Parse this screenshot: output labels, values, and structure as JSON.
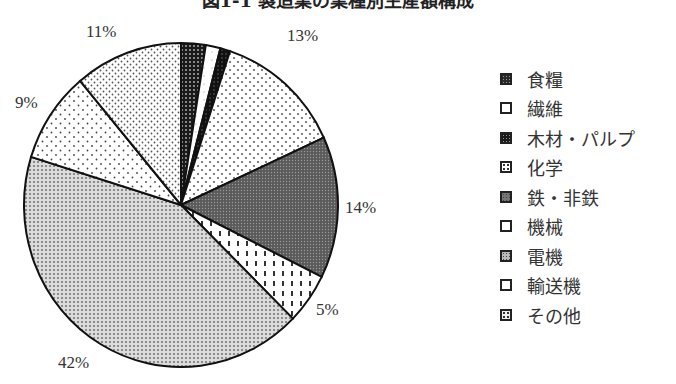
{
  "chart_data": {
    "type": "pie",
    "title": "図1-1 製造業の業種別生産額構成",
    "start_angle": "12 o'clock",
    "direction": "clockwise",
    "slices": [
      {
        "label": "食糧",
        "value": 2.5,
        "display": ""
      },
      {
        "label": "繊維",
        "value": 1.5,
        "display": ""
      },
      {
        "label": "木材・パルプ",
        "value": 1,
        "display": ""
      },
      {
        "label": "化学",
        "value": 13,
        "display": "13%"
      },
      {
        "label": "鉄・非鉄",
        "value": 14,
        "display": "14%"
      },
      {
        "label": "機械",
        "value": 5,
        "display": "5%"
      },
      {
        "label": "電機",
        "value": 42,
        "display": "42%"
      },
      {
        "label": "輸送機",
        "value": 9,
        "display": "9%"
      },
      {
        "label": "その他",
        "value": 11,
        "display": "11%"
      }
    ],
    "legend_position": "right"
  },
  "title": "図1-1 製造業の業種別生産額構成",
  "labels": {
    "chem": "13%",
    "iron": "14%",
    "mach": "5%",
    "elec": "42%",
    "trans": "9%",
    "other": "11%"
  },
  "legend": [
    {
      "label": "食糧"
    },
    {
      "label": "繊維"
    },
    {
      "label": "木材・パルプ"
    },
    {
      "label": "化学"
    },
    {
      "label": "鉄・非鉄"
    },
    {
      "label": "機械"
    },
    {
      "label": "電機"
    },
    {
      "label": "輸送機"
    },
    {
      "label": "その他"
    }
  ]
}
